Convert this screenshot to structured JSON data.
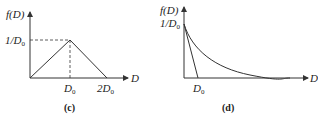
{
  "panels": [
    {
      "caption": "(c)",
      "y_label": "f(D)",
      "x_label": "D",
      "y_tick": "1/D",
      "y_tick_sub": "0",
      "x_ticks": [
        {
          "main": "D",
          "sub": "0"
        },
        {
          "main": "2D",
          "sub": "0"
        }
      ],
      "shape": "triangular distribution rising from 0 to peak 1/D0 at D0, falling to 0 at 2D0"
    },
    {
      "caption": "(d)",
      "y_label": "f(D)",
      "x_label": "D",
      "y_tick": "1/D",
      "y_tick_sub": "0",
      "x_ticks": [
        {
          "main": "D",
          "sub": "0"
        }
      ],
      "shape": "exponential decay from 1/D0 with tangent line intersecting x-axis at D0"
    }
  ],
  "colors": {
    "line": "#333333",
    "background": "#ffffff"
  }
}
